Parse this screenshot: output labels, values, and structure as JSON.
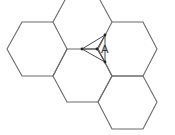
{
  "diagram": {
    "title": "",
    "hexagon_count": 4,
    "label": "A",
    "stroke_color": "#6b6b6b",
    "background": "#ffffff"
  }
}
